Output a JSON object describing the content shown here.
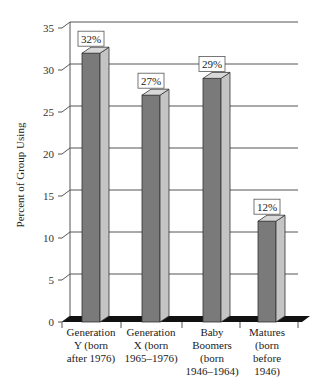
{
  "chart_data": {
    "type": "bar",
    "title": "",
    "xlabel": "",
    "ylabel": "Percent of Group Using",
    "ylim": [
      0,
      35
    ],
    "yticks": [
      0,
      5,
      10,
      15,
      20,
      25,
      30,
      35
    ],
    "grid": true,
    "legend": null,
    "style": "3d-bar",
    "categories": [
      [
        "Generation",
        "Y (born",
        "after 1976)"
      ],
      [
        "Generation",
        "X (born",
        "1965–1976)"
      ],
      [
        "Baby",
        "Boomers",
        "(born",
        "1946–1964)"
      ],
      [
        "Matures",
        "(born",
        "before",
        "1946)"
      ]
    ],
    "values": [
      32,
      27,
      29,
      12
    ],
    "data_labels": [
      "32%",
      "27%",
      "29%",
      "12%"
    ]
  },
  "colors": {
    "bar_front": "#7a7a7a",
    "bar_side": "#c4c4c4",
    "bar_top": "#d8d8d8",
    "floor": "#111111",
    "grid": "#555555"
  }
}
